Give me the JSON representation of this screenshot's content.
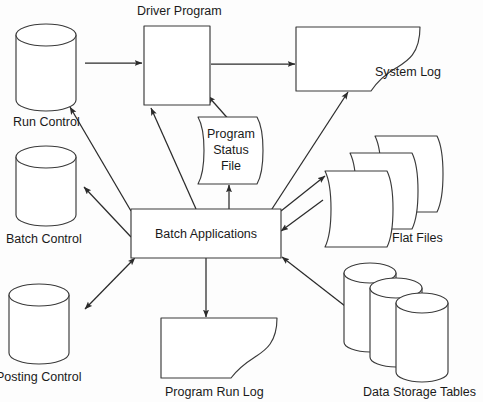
{
  "diagram": {
    "background_color": "#fdfdfd",
    "stroke_color": "#3a3a3a",
    "text_color": "#1a1a1a",
    "nodes": {
      "driver_program": {
        "label": "Driver Program",
        "shape": "process-box",
        "label_position": "above"
      },
      "run_control": {
        "label": "Run Control",
        "shape": "cylinder",
        "label_position": "below"
      },
      "batch_control": {
        "label": "Batch Control",
        "shape": "cylinder",
        "label_position": "below"
      },
      "posting_control": {
        "label": "Posting Control",
        "shape": "cylinder",
        "label_position": "below",
        "note": "clipped at left image edge"
      },
      "program_status_file": {
        "label_line1": "Program",
        "label_line2": "Status",
        "label_line3": "File",
        "shape": "flat-file",
        "label_position": "inside"
      },
      "batch_applications": {
        "label": "Batch Applications",
        "shape": "process-box",
        "label_position": "inside"
      },
      "system_log": {
        "label": "System Log",
        "shape": "document",
        "label_position": "right"
      },
      "program_run_log": {
        "label": "Program Run Log",
        "shape": "document",
        "label_position": "below"
      },
      "flat_files": {
        "label": "Flat Files",
        "shape": "stacked-flat-files",
        "count": 3,
        "label_position": "below-right"
      },
      "data_storage_tables": {
        "label": "Data Storage Tables",
        "shape": "stacked-cylinders",
        "count": 3,
        "label_position": "below"
      }
    },
    "edges": [
      {
        "from": "run_control",
        "to": "driver_program",
        "arrow": "single"
      },
      {
        "from": "driver_program",
        "to": "system_log",
        "arrow": "single"
      },
      {
        "from": "program_status_file",
        "to": "driver_program",
        "arrow": "single"
      },
      {
        "from": "batch_applications",
        "to": "program_status_file",
        "arrow": "single"
      },
      {
        "from": "batch_applications",
        "to": "driver_program",
        "arrow": "single"
      },
      {
        "from": "batch_control",
        "to": "run_control",
        "arrow": "single"
      },
      {
        "from": "batch_applications",
        "to": "batch_control",
        "arrow": "single"
      },
      {
        "from": "batch_applications",
        "to": "posting_control",
        "arrow": "double"
      },
      {
        "from": "batch_applications",
        "to": "program_run_log",
        "arrow": "single"
      },
      {
        "from": "batch_applications",
        "to": "system_log",
        "arrow": "single"
      },
      {
        "from": "flat_files",
        "to": "batch_applications",
        "arrow": "single"
      },
      {
        "from": "batch_applications",
        "to": "flat_files",
        "arrow": "single"
      },
      {
        "from": "data_storage_tables",
        "to": "batch_applications",
        "arrow": "single"
      }
    ]
  }
}
